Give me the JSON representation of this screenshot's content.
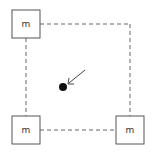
{
  "diagram": {
    "nodes": [
      {
        "id": "top-left",
        "label": "m"
      },
      {
        "id": "bottom-left",
        "label": "m"
      },
      {
        "id": "bottom-right",
        "label": "m"
      }
    ],
    "colors": {
      "stroke": "#555555",
      "dashed": "#666666",
      "dot": "#111111"
    }
  }
}
